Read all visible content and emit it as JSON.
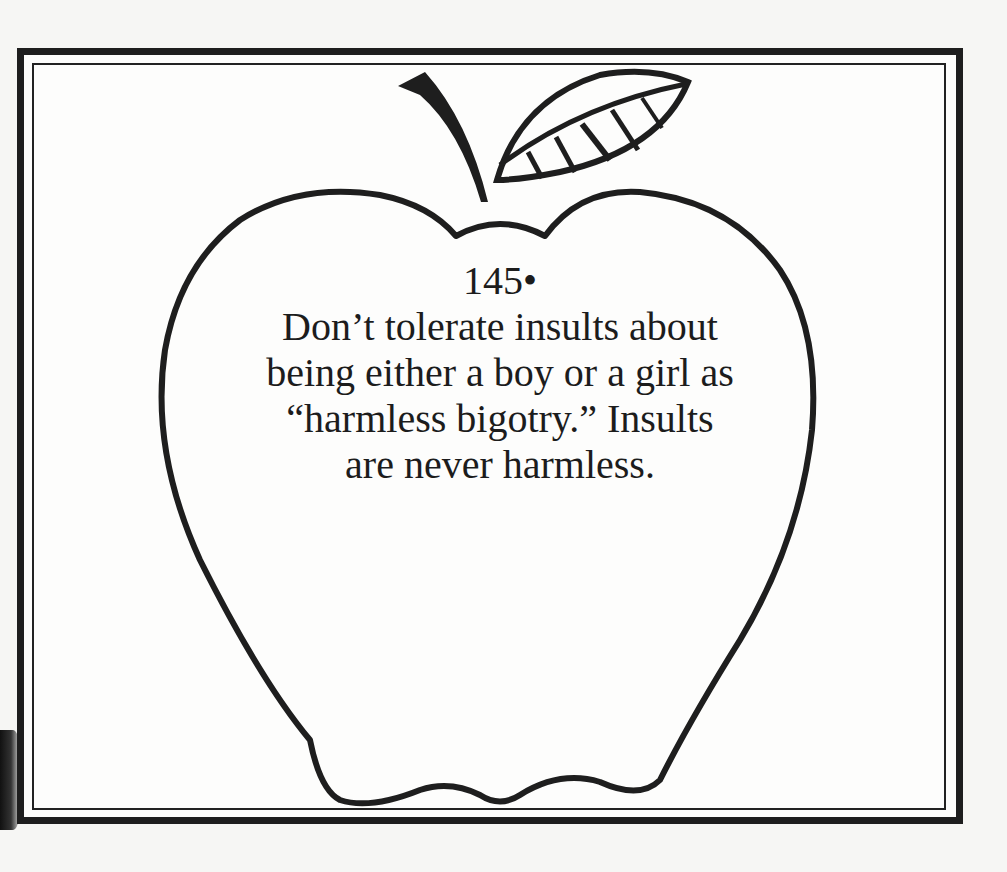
{
  "card": {
    "number": "145",
    "bullet": "•",
    "lines": [
      "Don’t tolerate insults about",
      "being either a boy or a girl as",
      "“harmless bigotry.” Insults",
      "are never harmless."
    ]
  },
  "colors": {
    "ink": "#1e1e1e",
    "paper": "#fdfdfc"
  }
}
